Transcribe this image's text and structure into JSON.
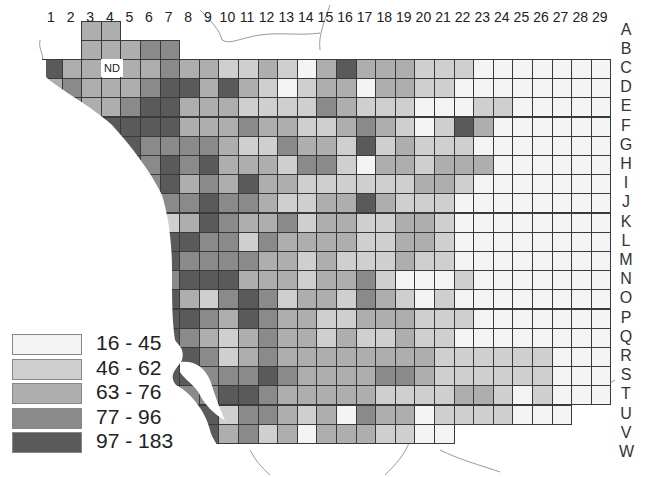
{
  "chart_data": {
    "type": "heatmap",
    "title": "",
    "columns": [
      "1",
      "2",
      "3",
      "4",
      "5",
      "6",
      "7",
      "8",
      "9",
      "10",
      "11",
      "12",
      "13",
      "14",
      "15",
      "16",
      "17",
      "18",
      "19",
      "20",
      "21",
      "22",
      "23",
      "24",
      "25",
      "26",
      "27",
      "28",
      "29"
    ],
    "rows": [
      "A",
      "B",
      "C",
      "D",
      "E",
      "F",
      "G",
      "H",
      "I",
      "J",
      "K",
      "L",
      "M",
      "N",
      "O",
      "P",
      "Q",
      "R",
      "S",
      "T",
      "U",
      "V",
      "W"
    ],
    "legend": [
      {
        "label": "16 - 45",
        "color": "#f4f4f4"
      },
      {
        "label": "46 - 62",
        "color": "#cfcfcf"
      },
      {
        "label": "63 - 76",
        "color": "#aeaeae"
      },
      {
        "label": "77 - 96",
        "color": "#8a8a8a"
      },
      {
        "label": "97 - 183",
        "color": "#5a5a5a"
      }
    ],
    "annotation": "ND",
    "annotation_cell": "C4",
    "levels_note": "grid values are legend class indices 1-5; 0 = outside map / no data",
    "grid": {
      "A": "00330000000000000000000000000",
      "B": "00333440000000000000000000000",
      "C": "53303343322321353332221111111",
      "D": "34333455353212331332211111111",
      "E": "04334553332222432221112211111",
      "F": "00455553334332234321253111111",
      "G": "00055444432243325232221111111",
      "H": "00035454533324421332333111111",
      "I": "00004453435332222223321111111",
      "J": "00005544544322335322211111111",
      "K": "00000523543342332233211111111",
      "L": "00000555442433332233211111111",
      "M": "00000554444332322232211111111",
      "N": "00000545553332334211121111111",
      "O": "00000453245423324321211111111",
      "P": "00000455435433223332221111111",
      "Q": "00000554323433232232211111111",
      "R": "00000045423433333333222222111",
      "S": "00000055444543333443222222111",
      "T": "00000004455433333222233212111",
      "U": "00000004524432314331222211100",
      "V": "00000005534231333221100000000",
      "W": "00000000000000000000000000000"
    }
  },
  "labels": {
    "nd": "ND"
  }
}
